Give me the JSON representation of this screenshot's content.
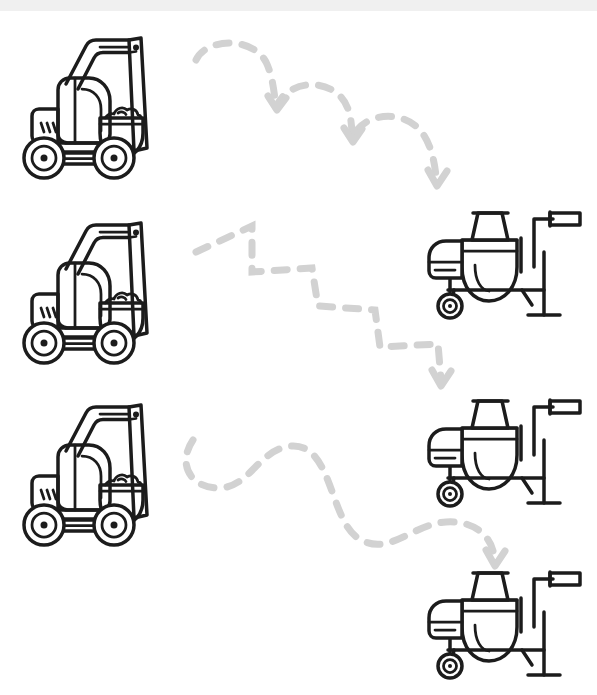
{
  "page": {
    "width": 597,
    "height": 695,
    "background_color": "#ffffff",
    "topbar_color": "#f0f0f0",
    "outline_color": "#1c1c1c",
    "path_color": "#d2d2d2"
  },
  "nodes": [
    {
      "id": "excavator-1",
      "label": "Excavator",
      "icon": "excavator-icon",
      "row": 1,
      "column": "left",
      "x": 10,
      "y": 25
    },
    {
      "id": "mixer-1",
      "label": "Cement Mixer",
      "icon": "cement-mixer-icon",
      "row": 1,
      "column": "right",
      "x": 424,
      "y": 192
    },
    {
      "id": "excavator-2",
      "label": "Excavator",
      "icon": "excavator-icon",
      "row": 2,
      "column": "left",
      "x": 10,
      "y": 210
    },
    {
      "id": "mixer-2",
      "label": "Cement Mixer",
      "icon": "cement-mixer-icon",
      "row": 2,
      "column": "right",
      "x": 424,
      "y": 380
    },
    {
      "id": "excavator-3",
      "label": "Excavator",
      "icon": "excavator-icon",
      "row": 3,
      "column": "left",
      "x": 10,
      "y": 392
    },
    {
      "id": "mixer-3",
      "label": "Cement Mixer",
      "icon": "cement-mixer-icon",
      "row": 3,
      "column": "right",
      "x": 424,
      "y": 552
    }
  ],
  "connectors": [
    {
      "id": "connector-1",
      "style": "bouncing-arcs",
      "from": "excavator-1",
      "to": "mixer-1",
      "path": "M 196 60 C 206 38, 252 36, 266 62 C 272 74, 274 90, 276 108 C 284 84, 320 76, 340 96 C 350 106, 352 122, 352 138 C 362 114, 400 108, 420 130 C 430 142, 434 158, 436 176",
      "arrow_heads": [
        {
          "d": "M 268 96 L 277 110 L 286 98"
        },
        {
          "d": "M 344 128 L 353 142 L 362 129"
        },
        {
          "d": "M 428 170 L 437 186 L 447 171"
        }
      ]
    },
    {
      "id": "connector-2",
      "style": "staircase-zigzag",
      "from": "excavator-2",
      "to": "mixer-2",
      "path": "M 196 252 L 252 226 L 252 272 L 312 268 L 318 306 L 375 310 L 380 347 L 438 344 L 441 380",
      "arrow_heads": [
        {
          "d": "M 432 370 L 441 386 L 451 371"
        }
      ]
    },
    {
      "id": "connector-3",
      "style": "wavy-s-curve",
      "from": "excavator-3",
      "to": "mixer-3",
      "path": "M 193 440 C 178 462, 188 486, 216 488 C 250 490, 258 448, 292 446 C 332 444, 330 520, 358 538 C 388 558, 412 524, 446 522 C 476 520, 492 538, 494 556",
      "arrow_heads": [
        {
          "d": "M 486 550 L 495 566 L 505 551"
        }
      ]
    }
  ],
  "icons": {
    "excavator": {
      "name": "excavator-icon",
      "width": 190,
      "height": 150
    },
    "cement_mixer": {
      "name": "cement-mixer-icon",
      "width": 163,
      "height": 140
    },
    "arrow": {
      "name": "arrow-head-icon"
    }
  }
}
